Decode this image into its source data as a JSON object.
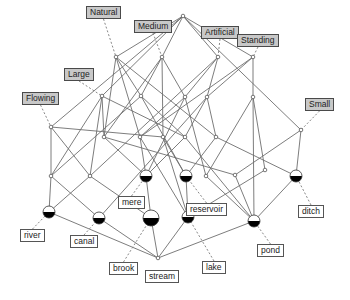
{
  "diagram": {
    "type": "concept-lattice",
    "attributes": [
      {
        "id": "natural",
        "label": "Natural",
        "x": 86,
        "y": 6,
        "node": "n_natural"
      },
      {
        "id": "medium",
        "label": "Medium",
        "x": 134,
        "y": 20,
        "node": "n_medium"
      },
      {
        "id": "artificial",
        "label": "Artificial",
        "x": 201,
        "y": 26,
        "node": "n_artificial"
      },
      {
        "id": "standing",
        "label": "Standing",
        "x": 237,
        "y": 34,
        "node": "n_standing"
      },
      {
        "id": "large",
        "label": "Large",
        "x": 64,
        "y": 68,
        "node": "n_large"
      },
      {
        "id": "flowing",
        "label": "Flowing",
        "x": 22,
        "y": 92,
        "node": "n_flowing"
      },
      {
        "id": "small",
        "label": "Small",
        "x": 305,
        "y": 98,
        "node": "n_small"
      }
    ],
    "objects": [
      {
        "id": "river",
        "label": "river",
        "x": 20,
        "y": 229,
        "node": "o_river"
      },
      {
        "id": "canal",
        "label": "canal",
        "x": 70,
        "y": 235,
        "node": "o_canal"
      },
      {
        "id": "mere",
        "label": "mere",
        "x": 118,
        "y": 196,
        "node": "o_mere"
      },
      {
        "id": "reservoir",
        "label": "reservoir",
        "x": 186,
        "y": 203,
        "node": "o_reservoir"
      },
      {
        "id": "ditch",
        "label": "ditch",
        "x": 298,
        "y": 205,
        "node": "o_ditch"
      },
      {
        "id": "pond",
        "label": "pond",
        "x": 257,
        "y": 244,
        "node": "o_pond"
      },
      {
        "id": "brook",
        "label": "brook",
        "x": 109,
        "y": 262,
        "node": "o_brook"
      },
      {
        "id": "stream",
        "label": "stream",
        "x": 145,
        "y": 270,
        "node": "o_stream"
      },
      {
        "id": "lake",
        "label": "lake",
        "x": 202,
        "y": 261,
        "node": "o_lake"
      }
    ],
    "nodes": [
      {
        "id": "top",
        "x": 183,
        "y": 16,
        "r": 1.8,
        "kind": "small"
      },
      {
        "id": "n_natural",
        "x": 116,
        "y": 57,
        "r": 1.8,
        "kind": "small"
      },
      {
        "id": "n_medium",
        "x": 162,
        "y": 57,
        "r": 1.8,
        "kind": "small"
      },
      {
        "id": "n_artificial",
        "x": 218,
        "y": 57,
        "r": 1.8,
        "kind": "small"
      },
      {
        "id": "n_standing",
        "x": 253,
        "y": 57,
        "r": 1.8,
        "kind": "small"
      },
      {
        "id": "n_large",
        "x": 102,
        "y": 96,
        "r": 1.8,
        "kind": "small"
      },
      {
        "id": "n_flowing",
        "x": 51,
        "y": 127,
        "r": 1.8,
        "kind": "small"
      },
      {
        "id": "n_small",
        "x": 301,
        "y": 130,
        "r": 1.8,
        "kind": "small"
      },
      {
        "id": "m1",
        "x": 141,
        "y": 96,
        "r": 1.8,
        "kind": "small"
      },
      {
        "id": "m2",
        "x": 185,
        "y": 97,
        "r": 1.8,
        "kind": "small"
      },
      {
        "id": "m3",
        "x": 207,
        "y": 97,
        "r": 1.8,
        "kind": "small"
      },
      {
        "id": "m4",
        "x": 253,
        "y": 97,
        "r": 1.8,
        "kind": "small"
      },
      {
        "id": "l1",
        "x": 104,
        "y": 137,
        "r": 1.8,
        "kind": "small"
      },
      {
        "id": "l2",
        "x": 140,
        "y": 137,
        "r": 1.8,
        "kind": "small"
      },
      {
        "id": "l3",
        "x": 163,
        "y": 137,
        "r": 1.8,
        "kind": "small"
      },
      {
        "id": "l4",
        "x": 185,
        "y": 137,
        "r": 1.8,
        "kind": "small"
      },
      {
        "id": "l5",
        "x": 216,
        "y": 137,
        "r": 1.8,
        "kind": "small"
      },
      {
        "id": "l6",
        "x": 51,
        "y": 176,
        "r": 1.8,
        "kind": "small"
      },
      {
        "id": "l7",
        "x": 90,
        "y": 176,
        "r": 1.8,
        "kind": "small"
      },
      {
        "id": "l8",
        "x": 206,
        "y": 176,
        "r": 1.8,
        "kind": "small"
      },
      {
        "id": "l9",
        "x": 235,
        "y": 175,
        "r": 1.8,
        "kind": "small"
      },
      {
        "id": "l10",
        "x": 265,
        "y": 170,
        "r": 1.8,
        "kind": "small"
      },
      {
        "id": "o_river",
        "x": 49,
        "y": 212,
        "r": 6,
        "kind": "object"
      },
      {
        "id": "o_canal",
        "x": 99,
        "y": 218,
        "r": 6,
        "kind": "object"
      },
      {
        "id": "o_mere",
        "x": 146,
        "y": 176,
        "r": 6,
        "kind": "object"
      },
      {
        "id": "o_reservoir",
        "x": 186,
        "y": 176,
        "r": 6,
        "kind": "object"
      },
      {
        "id": "o_ditch",
        "x": 296,
        "y": 176,
        "r": 6,
        "kind": "object"
      },
      {
        "id": "o_pond",
        "x": 254,
        "y": 221,
        "r": 6,
        "kind": "object"
      },
      {
        "id": "o_brook",
        "x": 151,
        "y": 218,
        "r": 8,
        "kind": "object"
      },
      {
        "id": "o_lake",
        "x": 188,
        "y": 217,
        "r": 6,
        "kind": "object"
      },
      {
        "id": "bottom",
        "x": 158,
        "y": 258,
        "r": 1.8,
        "kind": "small"
      }
    ],
    "edges": [
      [
        "top",
        "n_natural"
      ],
      [
        "top",
        "n_medium"
      ],
      [
        "top",
        "n_artificial"
      ],
      [
        "top",
        "n_standing"
      ],
      [
        "top",
        "n_large"
      ],
      [
        "top",
        "n_flowing"
      ],
      [
        "top",
        "n_small"
      ],
      [
        "n_natural",
        "m1"
      ],
      [
        "n_natural",
        "l1"
      ],
      [
        "n_natural",
        "l2"
      ],
      [
        "n_natural",
        "l5"
      ],
      [
        "n_medium",
        "m1"
      ],
      [
        "n_medium",
        "m2"
      ],
      [
        "n_medium",
        "l3"
      ],
      [
        "n_medium",
        "l1"
      ],
      [
        "n_artificial",
        "m2"
      ],
      [
        "n_artificial",
        "m3"
      ],
      [
        "n_artificial",
        "l7"
      ],
      [
        "n_standing",
        "m4"
      ],
      [
        "n_standing",
        "m3"
      ],
      [
        "n_standing",
        "l2"
      ],
      [
        "n_large",
        "l1"
      ],
      [
        "n_large",
        "l4"
      ],
      [
        "n_large",
        "l6"
      ],
      [
        "n_large",
        "l7"
      ],
      [
        "n_flowing",
        "l6"
      ],
      [
        "n_flowing",
        "l7"
      ],
      [
        "n_flowing",
        "l3"
      ],
      [
        "n_small",
        "o_ditch"
      ],
      [
        "n_small",
        "l9"
      ],
      [
        "m1",
        "l4"
      ],
      [
        "m1",
        "l6"
      ],
      [
        "m1",
        "o_reservoir"
      ],
      [
        "m2",
        "l2"
      ],
      [
        "m2",
        "l8"
      ],
      [
        "m2",
        "o_mere"
      ],
      [
        "m3",
        "l4"
      ],
      [
        "m3",
        "l5"
      ],
      [
        "m3",
        "o_canal"
      ],
      [
        "m4",
        "l8"
      ],
      [
        "m4",
        "o_pond"
      ],
      [
        "m4",
        "l10"
      ],
      [
        "l1",
        "o_mere"
      ],
      [
        "l1",
        "l9"
      ],
      [
        "l2",
        "o_mere"
      ],
      [
        "l2",
        "o_lake"
      ],
      [
        "l3",
        "o_reservoir"
      ],
      [
        "l3",
        "o_lake"
      ],
      [
        "l4",
        "o_mere"
      ],
      [
        "l4",
        "o_pond"
      ],
      [
        "l5",
        "o_reservoir"
      ],
      [
        "l5",
        "o_ditch"
      ],
      [
        "l6",
        "o_river"
      ],
      [
        "l6",
        "o_canal"
      ],
      [
        "l7",
        "o_river"
      ],
      [
        "l7",
        "o_brook"
      ],
      [
        "l8",
        "o_pond"
      ],
      [
        "l9",
        "o_pond"
      ],
      [
        "l10",
        "o_lake"
      ],
      [
        "o_river",
        "bottom"
      ],
      [
        "o_canal",
        "bottom"
      ],
      [
        "o_mere",
        "o_brook"
      ],
      [
        "o_reservoir",
        "o_lake"
      ],
      [
        "o_brook",
        "bottom"
      ],
      [
        "o_lake",
        "bottom"
      ],
      [
        "o_pond",
        "bottom"
      ],
      [
        "o_ditch",
        "o_pond"
      ]
    ],
    "colors": {
      "attr_box": "#c8c8c8",
      "obj_box": "#ffffff",
      "edge": "#6e6e6e",
      "node_fill_top": "#ffffff",
      "node_fill_bottom": "#000000"
    }
  }
}
